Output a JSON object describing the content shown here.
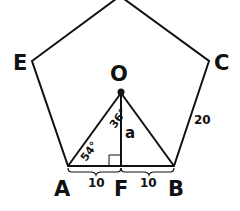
{
  "diagram": {
    "title": "",
    "vertices": {
      "E": {
        "label": "E",
        "x": 32,
        "y": 61
      },
      "C": {
        "label": "C",
        "x": 209,
        "y": 61
      },
      "A": {
        "label": "A",
        "x": 68,
        "y": 166
      },
      "B": {
        "label": "B",
        "x": 174,
        "y": 166
      },
      "top": {
        "label": "",
        "x": 120,
        "y": -4
      }
    },
    "center": {
      "label": "O",
      "x": 121,
      "y": 93
    },
    "foot": {
      "label": "F",
      "x": 121,
      "y": 166
    },
    "labels": {
      "O": "O",
      "E": "E",
      "C": "C",
      "A": "A",
      "F": "F",
      "B": "B",
      "side_length": "20",
      "half_left": "10",
      "half_right": "10",
      "apothem": "a",
      "angle_at_A": "54°",
      "angle_at_O": "36°"
    },
    "colors": {
      "stroke": "#111111",
      "background": "#ffffff"
    }
  }
}
